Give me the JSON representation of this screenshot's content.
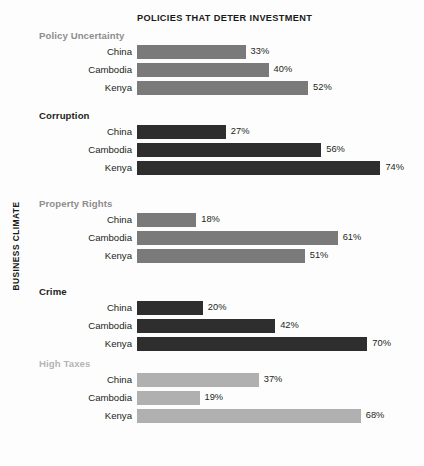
{
  "chart_data": {
    "type": "bar",
    "title": "POLICIES THAT DETER INVESTMENT",
    "xlabel": "",
    "ylabel": "BUSINESS CLIMATE",
    "orientation": "horizontal",
    "grid": false,
    "legend": "none",
    "value_suffix": "%",
    "xlim": [
      0,
      80
    ],
    "categories": [
      "China",
      "Cambodia",
      "Kenya"
    ],
    "groups": [
      {
        "name": "Policy Uncertainty",
        "color": "#7a7a7a",
        "label_color": "#8d8d8d",
        "values": [
          33,
          40,
          52
        ],
        "value_labels": [
          "33%",
          "40%",
          "52%"
        ]
      },
      {
        "name": "Corruption",
        "color": "#2e2e2e",
        "label_color": "#231f20",
        "values": [
          27,
          56,
          74
        ],
        "value_labels": [
          "27%",
          "56%",
          "74%"
        ]
      },
      {
        "name": "Property Rights",
        "color": "#7a7a7a",
        "label_color": "#8d8d8d",
        "values": [
          18,
          61,
          51
        ],
        "value_labels": [
          "18%",
          "61%",
          "51%"
        ]
      },
      {
        "name": "Crime",
        "color": "#2e2e2e",
        "label_color": "#231f20",
        "values": [
          20,
          42,
          70
        ],
        "value_labels": [
          "20%",
          "42%",
          "70%"
        ]
      },
      {
        "name": "High Taxes",
        "color": "#b0b0b0",
        "label_color": "#b4b4b4",
        "values": [
          37,
          19,
          68
        ],
        "value_labels": [
          "37%",
          "19%",
          "68%"
        ]
      }
    ]
  }
}
